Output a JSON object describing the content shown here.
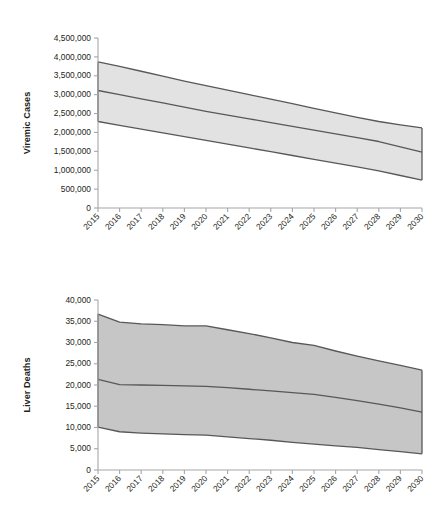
{
  "figure": {
    "background": "#ffffff",
    "band_fill_top": "#e2e2e2",
    "band_fill_bottom": "#c6c6c6",
    "line_color": "#585858",
    "axis_color": "#a6a6a6",
    "text_color": "#231f20"
  },
  "chart_data": [
    {
      "id": "viremic-cases",
      "type": "area",
      "title": "",
      "xlabel": "",
      "ylabel": "Viremic Cases",
      "grid": false,
      "legend": "none",
      "x": [
        2015,
        2016,
        2017,
        2018,
        2019,
        2020,
        2021,
        2022,
        2023,
        2024,
        2025,
        2026,
        2027,
        2028,
        2029,
        2030
      ],
      "xtick_labels": [
        "2015",
        "2016",
        "2017",
        "2018",
        "2019",
        "2020",
        "2021",
        "2022",
        "2023",
        "2024",
        "2025",
        "2026",
        "2027",
        "2028",
        "2029",
        "2030"
      ],
      "ylim": [
        0,
        4500000
      ],
      "ytick_values": [
        0,
        500000,
        1000000,
        1500000,
        2000000,
        2500000,
        3000000,
        3500000,
        4000000,
        4500000
      ],
      "ytick_labels": [
        "0",
        "500,000",
        "1,000,000",
        "1,500,000",
        "2,000,000",
        "2,500,000",
        "3,000,000",
        "3,500,000",
        "4,000,000",
        "4,500,000"
      ],
      "series": [
        {
          "name": "Upper bound",
          "values": [
            3870000,
            3750000,
            3620000,
            3490000,
            3360000,
            3240000,
            3120000,
            3000000,
            2880000,
            2760000,
            2640000,
            2520000,
            2400000,
            2290000,
            2200000,
            2120000
          ]
        },
        {
          "name": "Base case",
          "values": [
            3110000,
            3000000,
            2890000,
            2780000,
            2670000,
            2560000,
            2460000,
            2360000,
            2260000,
            2160000,
            2060000,
            1960000,
            1860000,
            1760000,
            1620000,
            1480000
          ]
        },
        {
          "name": "Lower bound",
          "values": [
            2290000,
            2190000,
            2090000,
            1990000,
            1890000,
            1790000,
            1690000,
            1590000,
            1490000,
            1390000,
            1290000,
            1190000,
            1090000,
            980000,
            860000,
            740000
          ]
        }
      ]
    },
    {
      "id": "liver-deaths",
      "type": "area",
      "title": "",
      "xlabel": "",
      "ylabel": "Liver Deaths",
      "grid": false,
      "legend": "none",
      "x": [
        2015,
        2016,
        2017,
        2018,
        2019,
        2020,
        2021,
        2022,
        2023,
        2024,
        2025,
        2026,
        2027,
        2028,
        2029,
        2030
      ],
      "xtick_labels": [
        "2015",
        "2016",
        "2017",
        "2018",
        "2019",
        "2020",
        "2021",
        "2022",
        "2023",
        "2024",
        "2025",
        "2026",
        "2027",
        "2028",
        "2029",
        "2030"
      ],
      "ylim": [
        0,
        40000
      ],
      "ytick_values": [
        0,
        5000,
        10000,
        15000,
        20000,
        25000,
        30000,
        35000,
        40000
      ],
      "ytick_labels": [
        "0",
        "5,000",
        "10,000",
        "15,000",
        "20,000",
        "25,000",
        "30,000",
        "35,000",
        "40,000"
      ],
      "series": [
        {
          "name": "Upper bound",
          "values": [
            36700,
            34800,
            34400,
            34200,
            33900,
            33900,
            33000,
            32100,
            31100,
            30000,
            29300,
            28000,
            26800,
            25700,
            24600,
            23500
          ]
        },
        {
          "name": "Base case",
          "values": [
            21300,
            20100,
            20000,
            19900,
            19800,
            19700,
            19400,
            19000,
            18600,
            18200,
            17800,
            17100,
            16300,
            15500,
            14600,
            13600
          ]
        },
        {
          "name": "Lower bound",
          "values": [
            10100,
            9000,
            8700,
            8500,
            8300,
            8200,
            7800,
            7400,
            7000,
            6500,
            6100,
            5700,
            5300,
            4800,
            4300,
            3800
          ]
        }
      ]
    }
  ]
}
